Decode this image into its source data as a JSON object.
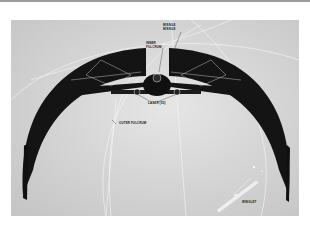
{
  "figure": {
    "labels": {
      "top_missile_line1": "MISSILE",
      "top_missile_line2": "MISSILE",
      "inner_fulcrum_line1": "INNER",
      "inner_fulcrum_line2": "FULCRUM",
      "lasers": "LASER (X2)",
      "outer_fulcrum": "OUTER FULCRUM",
      "winglet": "WINGLET"
    },
    "colors": {
      "background": "#d4d4d4",
      "hull": "#141414",
      "guide_lines": "#f4f4f4",
      "page": "#ffffff"
    }
  }
}
